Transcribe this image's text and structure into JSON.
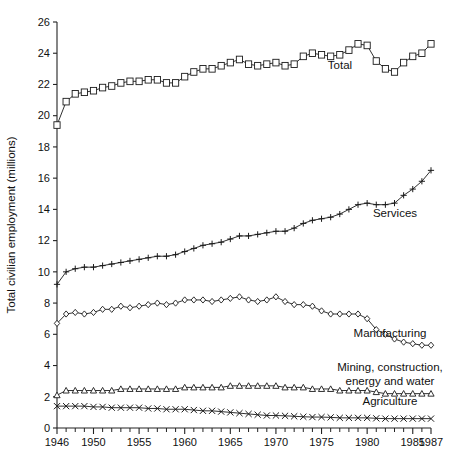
{
  "chart_data": {
    "type": "line",
    "title": "",
    "xlabel": "",
    "ylabel": "Total civilian employment (millions)",
    "xlim": [
      1946,
      1987
    ],
    "ylim": [
      0,
      26
    ],
    "grid": false,
    "legend_position": "inline-annotations",
    "ytick_labels": [
      "0",
      "2",
      "4",
      "6",
      "8",
      "10",
      "12",
      "14",
      "16",
      "18",
      "20",
      "22",
      "24",
      "26"
    ],
    "ytick_values": [
      0,
      2,
      4,
      6,
      8,
      10,
      12,
      14,
      16,
      18,
      20,
      22,
      24,
      26
    ],
    "xtick_labels": [
      "1946",
      "1950",
      "1955",
      "1960",
      "1965",
      "1970",
      "1975",
      "1980",
      "1985",
      "1987"
    ],
    "xtick_values": [
      1946,
      1950,
      1955,
      1960,
      1965,
      1970,
      1975,
      1980,
      1985,
      1987
    ],
    "x": [
      1946,
      1947,
      1948,
      1949,
      1950,
      1951,
      1952,
      1953,
      1954,
      1955,
      1956,
      1957,
      1958,
      1959,
      1960,
      1961,
      1962,
      1963,
      1964,
      1965,
      1966,
      1967,
      1968,
      1969,
      1970,
      1971,
      1972,
      1973,
      1974,
      1975,
      1976,
      1977,
      1978,
      1979,
      1980,
      1981,
      1982,
      1983,
      1984,
      1985,
      1986,
      1987
    ],
    "series": [
      {
        "name": "Total",
        "marker": "square",
        "label": "Total",
        "values": [
          19.4,
          20.9,
          21.4,
          21.5,
          21.6,
          21.8,
          21.9,
          22.1,
          22.2,
          22.2,
          22.3,
          22.3,
          22.1,
          22.1,
          22.5,
          22.8,
          23.0,
          23.0,
          23.2,
          23.4,
          23.6,
          23.3,
          23.2,
          23.3,
          23.4,
          23.2,
          23.3,
          23.8,
          24.0,
          23.9,
          23.8,
          23.9,
          24.2,
          24.6,
          24.5,
          23.5,
          23.0,
          22.8,
          23.4,
          23.8,
          24.0,
          24.6
        ]
      },
      {
        "name": "Services",
        "marker": "plus",
        "label": "Services",
        "values": [
          9.2,
          10.0,
          10.2,
          10.3,
          10.3,
          10.4,
          10.5,
          10.6,
          10.7,
          10.8,
          10.9,
          11.0,
          11.0,
          11.1,
          11.3,
          11.5,
          11.7,
          11.8,
          11.9,
          12.1,
          12.3,
          12.3,
          12.4,
          12.5,
          12.6,
          12.6,
          12.8,
          13.1,
          13.3,
          13.4,
          13.5,
          13.7,
          14.0,
          14.3,
          14.4,
          14.3,
          14.3,
          14.4,
          14.9,
          15.3,
          15.8,
          16.5
        ]
      },
      {
        "name": "Manufacturing",
        "marker": "diamond",
        "label": "Manufacturing",
        "values": [
          6.7,
          7.3,
          7.4,
          7.3,
          7.4,
          7.6,
          7.6,
          7.8,
          7.7,
          7.8,
          7.9,
          8.0,
          7.9,
          8.0,
          8.2,
          8.2,
          8.2,
          8.1,
          8.2,
          8.3,
          8.4,
          8.2,
          8.1,
          8.2,
          8.4,
          8.1,
          7.9,
          7.9,
          7.8,
          7.5,
          7.3,
          7.3,
          7.3,
          7.3,
          7.0,
          6.3,
          6.0,
          5.7,
          5.5,
          5.4,
          5.3,
          5.3
        ]
      },
      {
        "name": "Mining, construction, energy and water",
        "marker": "triangle",
        "label": "Mining, construction,\nenergy and water",
        "label_line1": "Mining, construction,",
        "label_line2": "energy and water",
        "values": [
          2.1,
          2.4,
          2.4,
          2.4,
          2.4,
          2.4,
          2.4,
          2.5,
          2.5,
          2.5,
          2.5,
          2.5,
          2.5,
          2.5,
          2.6,
          2.6,
          2.6,
          2.6,
          2.6,
          2.7,
          2.7,
          2.7,
          2.7,
          2.7,
          2.7,
          2.6,
          2.6,
          2.6,
          2.5,
          2.5,
          2.5,
          2.4,
          2.4,
          2.4,
          2.4,
          2.3,
          2.2,
          2.2,
          2.2,
          2.2,
          2.2,
          2.2
        ]
      },
      {
        "name": "Agriculture",
        "marker": "cross",
        "label": "Agriculture",
        "values": [
          1.4,
          1.4,
          1.4,
          1.4,
          1.35,
          1.35,
          1.3,
          1.3,
          1.3,
          1.3,
          1.25,
          1.25,
          1.2,
          1.2,
          1.2,
          1.15,
          1.1,
          1.1,
          1.05,
          1.0,
          0.95,
          0.9,
          0.85,
          0.8,
          0.8,
          0.78,
          0.75,
          0.72,
          0.7,
          0.7,
          0.68,
          0.65,
          0.65,
          0.65,
          0.65,
          0.62,
          0.6,
          0.6,
          0.6,
          0.6,
          0.6,
          0.6
        ]
      }
    ],
    "annotations": [
      {
        "text": "Total",
        "series": "Total"
      },
      {
        "text": "Services",
        "series": "Services"
      },
      {
        "text": "Manufacturing",
        "series": "Manufacturing"
      },
      {
        "text": "Mining, construction,",
        "series": "Mining, construction, energy and water"
      },
      {
        "text": "energy and water",
        "series": "Mining, construction, energy and water"
      },
      {
        "text": "Agriculture",
        "series": "Agriculture"
      }
    ],
    "colors": {
      "line": "#1a1a1a",
      "marker_fill": "#ffffff",
      "axis": "#222222",
      "background": "#ffffff"
    }
  }
}
